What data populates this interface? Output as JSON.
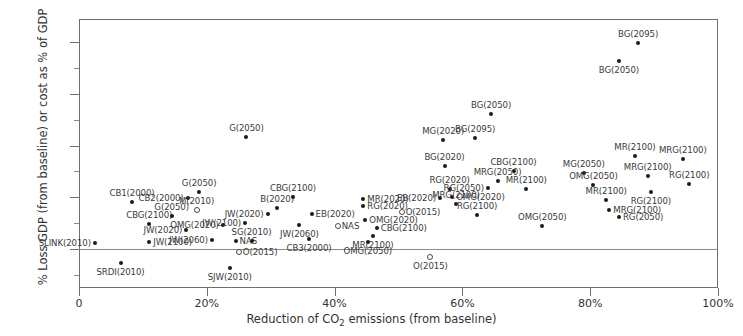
{
  "chart_data": {
    "type": "scatter",
    "title": "",
    "xlabel": "Reduction of CO2 emissions (from baseline)",
    "xlabel_parts": {
      "pre": "Reduction of CO",
      "sub": "2",
      "post": " emissions (from baseline)"
    },
    "ylabel": "% Loss GDP (from baseline) or cost as % of GDP",
    "xlim": [
      0,
      100
    ],
    "ylim": [
      -1.4,
      9.0
    ],
    "grid": false,
    "legend": "none",
    "x_ticks": [
      "0",
      "20%",
      "40%",
      "60%",
      "80%",
      "100%"
    ],
    "x_tick_values": [
      0,
      20,
      40,
      60,
      80,
      100
    ],
    "y_ticks": [
      "0",
      "2%",
      "4%",
      "6%",
      "8%"
    ],
    "y_tick_values": [
      0,
      2,
      4,
      6,
      8
    ],
    "y_minor_values": [
      -1,
      1,
      3,
      5,
      7,
      9
    ],
    "marker_colors": {
      "filled": "#1a1a1a",
      "open": "#4a4a4a"
    },
    "axis_color": "#6e6e6e",
    "points": [
      {
        "label": "SLINK(2010)",
        "x": 2.5,
        "y": 0.25,
        "marker": "filled",
        "anchor": "e"
      },
      {
        "label": "SRDI(2010)",
        "x": 6.5,
        "y": -0.55,
        "marker": "filled",
        "anchor": "s"
      },
      {
        "label": "CB1(2000)",
        "x": 8.3,
        "y": 1.82,
        "marker": "filled",
        "anchor": "n"
      },
      {
        "label": "CBG(2100)",
        "x": 11.0,
        "y": 0.95,
        "marker": "filled",
        "anchor": "n"
      },
      {
        "label": "JW(2100)",
        "x": 11.0,
        "y": 0.28,
        "marker": "filled",
        "anchor": "w"
      },
      {
        "label": "G(2050)",
        "x": 14.5,
        "y": 1.28,
        "marker": "filled",
        "anchor": "n"
      },
      {
        "label": "CB2(2000)",
        "x": 17.0,
        "y": 1.98,
        "marker": "filled",
        "anchor": "e"
      },
      {
        "label": "G(2050)",
        "x": 18.8,
        "y": 2.22,
        "marker": "filled",
        "anchor": "n"
      },
      {
        "label": "JW(2020)",
        "x": 16.8,
        "y": 0.72,
        "marker": "filled",
        "anchor": "e"
      },
      {
        "label": "M(2010)",
        "x": 18.4,
        "y": 1.52,
        "marker": "open",
        "anchor": "n"
      },
      {
        "label": "JW(2060)",
        "x": 20.8,
        "y": 0.35,
        "marker": "filled",
        "anchor": "e"
      },
      {
        "label": "OMG(2020)",
        "x": 22.5,
        "y": 0.92,
        "marker": "filled",
        "anchor": "e"
      },
      {
        "label": "SJW(2010)",
        "x": 23.6,
        "y": -0.72,
        "marker": "filled",
        "anchor": "s"
      },
      {
        "label": "NAS",
        "x": 24.5,
        "y": 0.3,
        "marker": "filled",
        "anchor": "w"
      },
      {
        "label": "O(2015)",
        "x": 25.0,
        "y": -0.1,
        "marker": "open",
        "anchor": "w"
      },
      {
        "label": "JW(2100)",
        "x": 26.0,
        "y": 1.02,
        "marker": "filled",
        "anchor": "e"
      },
      {
        "label": "SG(2010)",
        "x": 27.0,
        "y": 0.3,
        "marker": "filled",
        "anchor": "n"
      },
      {
        "label": "G(2050)",
        "x": 26.2,
        "y": 4.32,
        "marker": "filled",
        "anchor": "n"
      },
      {
        "label": "JW(2020)",
        "x": 29.5,
        "y": 1.35,
        "marker": "filled",
        "anchor": "e"
      },
      {
        "label": "B(2020)",
        "x": 31.0,
        "y": 1.58,
        "marker": "filled",
        "anchor": "n"
      },
      {
        "label": "CBG(2100)",
        "x": 33.5,
        "y": 2.0,
        "marker": "filled",
        "anchor": "n"
      },
      {
        "label": "JW(2060)",
        "x": 34.5,
        "y": 0.92,
        "marker": "filled",
        "anchor": "s"
      },
      {
        "label": "CB3(2000)",
        "x": 36.0,
        "y": 0.38,
        "marker": "filled",
        "anchor": "s"
      },
      {
        "label": "EB(2020)",
        "x": 36.4,
        "y": 1.35,
        "marker": "filled",
        "anchor": "w"
      },
      {
        "label": "NAS",
        "x": 40.5,
        "y": 0.88,
        "marker": "open",
        "anchor": "w"
      },
      {
        "label": "MR(2020)",
        "x": 44.5,
        "y": 1.92,
        "marker": "filled",
        "anchor": "w"
      },
      {
        "label": "RG(2020)",
        "x": 44.5,
        "y": 1.65,
        "marker": "filled",
        "anchor": "w"
      },
      {
        "label": "OMG(2020)",
        "x": 44.8,
        "y": 1.12,
        "marker": "filled",
        "anchor": "w"
      },
      {
        "label": "CBG(2100)",
        "x": 46.6,
        "y": 0.8,
        "marker": "filled",
        "anchor": "w"
      },
      {
        "label": "MR(2100)",
        "x": 46.0,
        "y": 0.52,
        "marker": "filled",
        "anchor": "s"
      },
      {
        "label": "OMG(2050)",
        "x": 45.2,
        "y": 0.28,
        "marker": "filled",
        "anchor": "s"
      },
      {
        "label": "O(2015)",
        "x": 50.5,
        "y": 1.42,
        "marker": "open",
        "anchor": "w"
      },
      {
        "label": "O(2015)",
        "x": 55.0,
        "y": -0.3,
        "marker": "open",
        "anchor": "s"
      },
      {
        "label": "EB(2020)",
        "x": 56.5,
        "y": 1.98,
        "marker": "filled",
        "anchor": "e"
      },
      {
        "label": "MG(2020)",
        "x": 57.0,
        "y": 4.22,
        "marker": "filled",
        "anchor": "n"
      },
      {
        "label": "BG(2020)",
        "x": 57.2,
        "y": 3.2,
        "marker": "filled",
        "anchor": "n"
      },
      {
        "label": "RG(2020)",
        "x": 58.0,
        "y": 2.32,
        "marker": "filled",
        "anchor": "n"
      },
      {
        "label": "OMG(2020)",
        "x": 58.4,
        "y": 2.0,
        "marker": "filled",
        "anchor": "w"
      },
      {
        "label": "MRG(2100)",
        "x": 59.0,
        "y": 1.72,
        "marker": "filled",
        "anchor": "n"
      },
      {
        "label": "BG(2095)",
        "x": 62.0,
        "y": 4.3,
        "marker": "filled",
        "anchor": "n"
      },
      {
        "label": "BG(2050)",
        "x": 64.5,
        "y": 5.2,
        "marker": "filled",
        "anchor": "n"
      },
      {
        "label": "RG(2100)",
        "x": 62.3,
        "y": 1.3,
        "marker": "filled",
        "anchor": "n"
      },
      {
        "label": "RG(2050)",
        "x": 64.0,
        "y": 2.35,
        "marker": "filled",
        "anchor": "e"
      },
      {
        "label": "MRG(2050)",
        "x": 65.5,
        "y": 2.62,
        "marker": "filled",
        "anchor": "n"
      },
      {
        "label": "CBG(2100)",
        "x": 68.0,
        "y": 3.02,
        "marker": "filled",
        "anchor": "n"
      },
      {
        "label": "MR(2100)",
        "x": 70.0,
        "y": 2.3,
        "marker": "filled",
        "anchor": "n"
      },
      {
        "label": "OMG(2050)",
        "x": 72.5,
        "y": 0.9,
        "marker": "filled",
        "anchor": "n"
      },
      {
        "label": "MG(2050)",
        "x": 79.0,
        "y": 2.95,
        "marker": "filled",
        "anchor": "n"
      },
      {
        "label": "OMG(2050)",
        "x": 80.5,
        "y": 2.48,
        "marker": "filled",
        "anchor": "n"
      },
      {
        "label": "MR(2100)",
        "x": 82.5,
        "y": 1.88,
        "marker": "filled",
        "anchor": "n"
      },
      {
        "label": "MRG(2100)",
        "x": 83.0,
        "y": 1.52,
        "marker": "filled",
        "anchor": "w"
      },
      {
        "label": "RG(2050)",
        "x": 84.5,
        "y": 1.22,
        "marker": "filled",
        "anchor": "w"
      },
      {
        "label": "BG(2050)",
        "x": 84.5,
        "y": 7.28,
        "marker": "filled",
        "anchor": "s"
      },
      {
        "label": "BG(2095)",
        "x": 87.5,
        "y": 7.95,
        "marker": "filled",
        "anchor": "n"
      },
      {
        "label": "MR(2100)",
        "x": 87.0,
        "y": 3.58,
        "marker": "filled",
        "anchor": "n"
      },
      {
        "label": "MRG(2100)",
        "x": 89.0,
        "y": 2.82,
        "marker": "filled",
        "anchor": "n"
      },
      {
        "label": "RG(2100)",
        "x": 89.5,
        "y": 2.22,
        "marker": "filled",
        "anchor": "s"
      },
      {
        "label": "MRG(2100)",
        "x": 94.5,
        "y": 3.48,
        "marker": "filled",
        "anchor": "n"
      },
      {
        "label": "RG(2100)",
        "x": 95.5,
        "y": 2.5,
        "marker": "filled",
        "anchor": "n"
      }
    ]
  }
}
